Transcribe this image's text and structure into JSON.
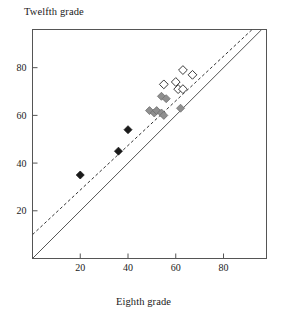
{
  "chart_data": {
    "type": "scatter",
    "title": "",
    "xlabel": "Eighth grade",
    "ylabel": "Twelfth grade",
    "xlim": [
      0,
      98
    ],
    "ylim": [
      0,
      96
    ],
    "xticks": [
      20,
      40,
      60,
      80
    ],
    "yticks": [
      20,
      40,
      60,
      80
    ],
    "grid": false,
    "legend": "none",
    "series": [
      {
        "name": "black-filled-diamonds",
        "marker": "filled-diamond",
        "color": "#1a1a1a",
        "points": [
          {
            "x": 20,
            "y": 35
          },
          {
            "x": 36,
            "y": 45
          },
          {
            "x": 40,
            "y": 54
          }
        ]
      },
      {
        "name": "gray-filled-diamonds",
        "marker": "filled-diamond",
        "color": "#8f8f8f",
        "points": [
          {
            "x": 49,
            "y": 62
          },
          {
            "x": 51,
            "y": 61
          },
          {
            "x": 52,
            "y": 62
          },
          {
            "x": 54,
            "y": 61
          },
          {
            "x": 55,
            "y": 60
          },
          {
            "x": 54,
            "y": 68
          },
          {
            "x": 56,
            "y": 67
          },
          {
            "x": 62,
            "y": 63
          }
        ]
      },
      {
        "name": "open-diamonds",
        "marker": "open-diamond",
        "color": "#ffffff",
        "points": [
          {
            "x": 55,
            "y": 73
          },
          {
            "x": 60,
            "y": 74
          },
          {
            "x": 61,
            "y": 71
          },
          {
            "x": 63,
            "y": 71
          },
          {
            "x": 63,
            "y": 79
          },
          {
            "x": 67,
            "y": 77
          }
        ]
      }
    ],
    "lines": [
      {
        "name": "identity-line",
        "style": "solid",
        "color": "#555555",
        "from": {
          "x": 0,
          "y": 0
        },
        "to": {
          "x": 96,
          "y": 96
        }
      },
      {
        "name": "regression-line",
        "style": "dashed",
        "color": "#333333",
        "from": {
          "x": 0,
          "y": 10
        },
        "to": {
          "x": 92,
          "y": 96
        }
      }
    ]
  },
  "frame": {
    "border_color": "#555555"
  }
}
